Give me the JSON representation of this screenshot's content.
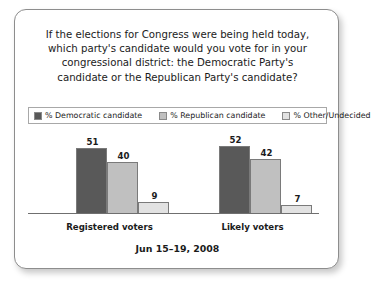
{
  "card": {
    "title_lines": [
      "If the elections for Congress were being held today,",
      "which party's candidate would you vote for in your",
      "congressional district: the Democratic Party's",
      "candidate or the Republican Party's candidate?"
    ],
    "footer_date": "Jun 15–19, 2008"
  },
  "legend": {
    "items": [
      {
        "label": "% Democratic candidate",
        "color": "#595959"
      },
      {
        "label": "% Republican candidate",
        "color": "#c0c0c0"
      },
      {
        "label": "% Other/Undecided",
        "color": "#e2e2e2"
      }
    ]
  },
  "chart_data": {
    "type": "bar",
    "subtitle": "Jun 15–19, 2008",
    "xlabel": "",
    "ylabel": "",
    "ylim": [
      0,
      60
    ],
    "grid": false,
    "legend_position": "top",
    "categories": [
      "Registered voters",
      "Likely voters"
    ],
    "series": [
      {
        "name": "% Democratic candidate",
        "color": "#595959",
        "values": [
          51,
          52
        ]
      },
      {
        "name": "% Republican candidate",
        "color": "#c0c0c0",
        "values": [
          40,
          42
        ]
      },
      {
        "name": "% Other/Undecided",
        "color": "#e2e2e2",
        "values": [
          9,
          7
        ]
      }
    ]
  }
}
